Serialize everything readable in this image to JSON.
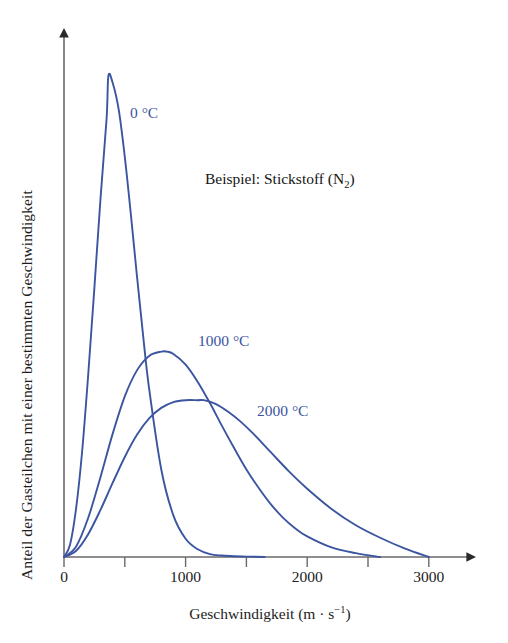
{
  "chart_data": {
    "type": "line",
    "title": "",
    "subtitle": "",
    "annotation_text": "Beispiel: Stickstoff (N",
    "annotation_sub": "2",
    "annotation_tail": ")",
    "xlabel_main": "Geschwindigkeit (m · s",
    "xlabel_sup": "−1",
    "xlabel_tail": ")",
    "ylabel": "Anteil der Gasteilchen mit einer bestimmten Geschwindigkeit",
    "xlim": [
      0,
      3400
    ],
    "ylim": [
      0,
      1.0
    ],
    "grid": false,
    "legend_position": "inline-annotations",
    "x_major_ticks": [
      0,
      1000,
      2000,
      3000
    ],
    "x_minor_ticks": [
      500,
      1500,
      2500
    ],
    "x_tick_labels": [
      "0",
      "1000",
      "2000",
      "3000"
    ],
    "y_ticks": [],
    "y_tick_labels": [],
    "curve_color": "#3c55a0",
    "axis_color": "#58565a",
    "series": [
      {
        "name": "0 °C",
        "label": "0 °C",
        "peak_speed": 365,
        "peak_height": 1.0,
        "tail_end_speed": 1650,
        "x": [
          0,
          50,
          100,
          150,
          200,
          250,
          300,
          350,
          365,
          400,
          450,
          500,
          550,
          600,
          650,
          700,
          800,
          900,
          1000,
          1100,
          1200,
          1300,
          1400,
          1500,
          1650
        ],
        "y": [
          0.0,
          0.026,
          0.102,
          0.222,
          0.382,
          0.56,
          0.744,
          0.91,
          1.0,
          0.986,
          0.93,
          0.832,
          0.712,
          0.584,
          0.462,
          0.35,
          0.182,
          0.086,
          0.038,
          0.016,
          0.006,
          0.003,
          0.0015,
          0.0008,
          0.0
        ]
      },
      {
        "name": "1000 °C",
        "label": "1000 °C",
        "peak_speed": 845,
        "peak_height": 0.427,
        "tail_end_speed": 2600,
        "x": [
          0,
          100,
          200,
          300,
          400,
          500,
          600,
          700,
          800,
          845,
          900,
          1000,
          1100,
          1200,
          1300,
          1400,
          1500,
          1600,
          1700,
          1800,
          1900,
          2000,
          2200,
          2400,
          2600
        ],
        "y": [
          0.0,
          0.022,
          0.082,
          0.166,
          0.256,
          0.334,
          0.388,
          0.418,
          0.427,
          0.427,
          0.422,
          0.4,
          0.364,
          0.32,
          0.272,
          0.226,
          0.182,
          0.144,
          0.11,
          0.082,
          0.06,
          0.043,
          0.02,
          0.008,
          0.0
        ]
      },
      {
        "name": "2000 °C",
        "label": "2000 °C",
        "peak_speed": 1150,
        "peak_height": 0.326,
        "tail_end_speed": 3000,
        "x": [
          0,
          100,
          200,
          300,
          400,
          500,
          600,
          700,
          800,
          900,
          1000,
          1100,
          1150,
          1250,
          1350,
          1450,
          1550,
          1700,
          1850,
          2000,
          2200,
          2400,
          2600,
          2800,
          3000
        ],
        "y": [
          0.0,
          0.013,
          0.048,
          0.098,
          0.154,
          0.208,
          0.254,
          0.288,
          0.31,
          0.322,
          0.326,
          0.326,
          0.326,
          0.318,
          0.302,
          0.282,
          0.258,
          0.218,
          0.178,
          0.142,
          0.1,
          0.066,
          0.04,
          0.018,
          0.0
        ]
      }
    ],
    "series_label_positions": [
      {
        "name": "0 °C",
        "x": 130,
        "y": 104
      },
      {
        "name": "1000 °C",
        "x": 198,
        "y": 332
      },
      {
        "name": "2000 °C",
        "x": 257,
        "y": 402
      }
    ]
  },
  "axes": {
    "x_arrow": true,
    "y_arrow": true
  }
}
